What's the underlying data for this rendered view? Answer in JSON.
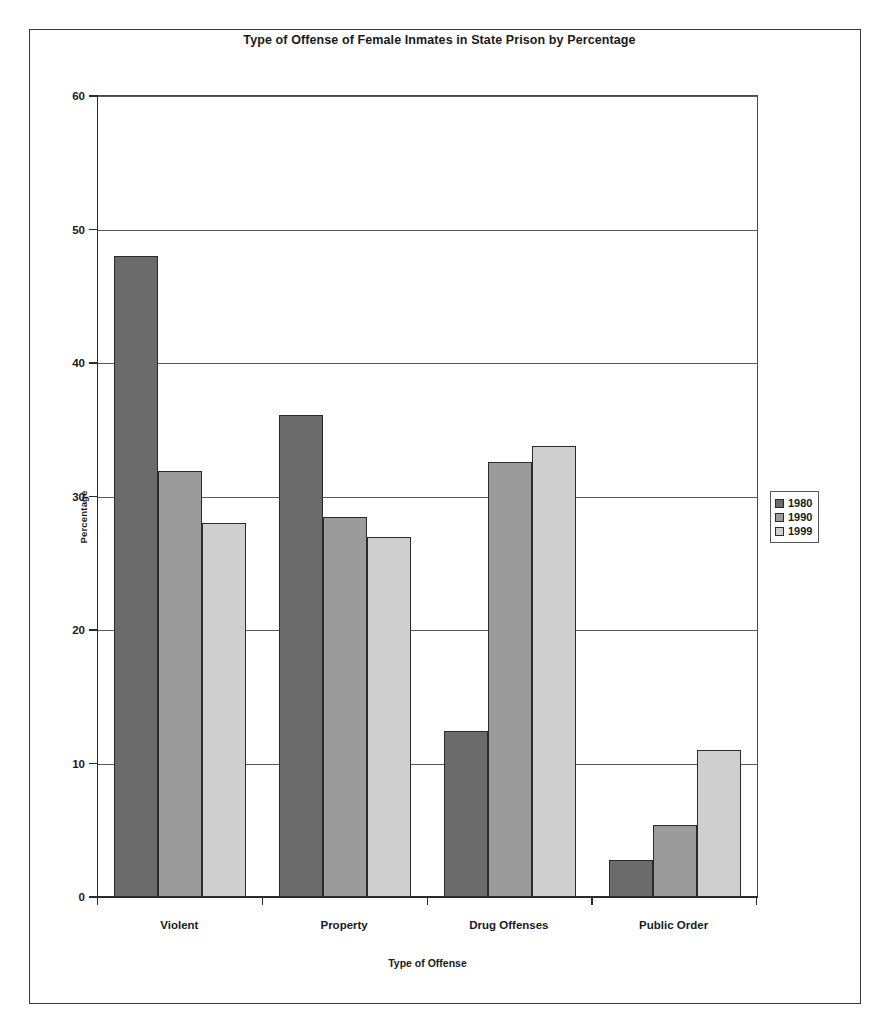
{
  "chart_data": {
    "type": "bar",
    "title": "Type of Offense of Female Inmates in State Prison by Percentage",
    "xlabel": "Type of Offense",
    "ylabel": "Percentage",
    "ylim": [
      0,
      60
    ],
    "yticks": [
      0,
      10,
      20,
      30,
      40,
      50,
      60
    ],
    "grid": true,
    "legend_position": "right",
    "categories": [
      "Violent",
      "Property",
      "Drug Offenses",
      "Public Order"
    ],
    "series": [
      {
        "name": "1980",
        "color": "#6b6b6b",
        "values": [
          48,
          36.1,
          12.4,
          2.8
        ]
      },
      {
        "name": "1990",
        "color": "#9b9b9b",
        "values": [
          31.9,
          28.5,
          32.6,
          5.4
        ]
      },
      {
        "name": "1999",
        "color": "#cfcfcf",
        "values": [
          28,
          27,
          33.8,
          11
        ]
      }
    ]
  }
}
